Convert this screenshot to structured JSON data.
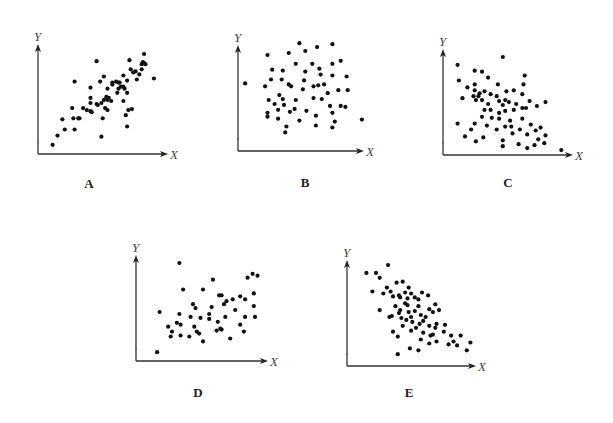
{
  "figure": {
    "background": "#ffffff",
    "dot_color": "#111111"
  },
  "chart_data": [
    {
      "type": "scatter",
      "panel": "A",
      "title": "A",
      "xlabel": "X",
      "ylabel": "Y",
      "xlim": [
        0,
        10
      ],
      "ylim": [
        0,
        10
      ],
      "grid": false,
      "trend": "strong positive",
      "points": [
        [
          1.2,
          0.9
        ],
        [
          1.6,
          1.8
        ],
        [
          2.0,
          3.4
        ],
        [
          2.2,
          2.4
        ],
        [
          2.8,
          4.5
        ],
        [
          2.9,
          3.5
        ],
        [
          3.0,
          2.4
        ],
        [
          3.0,
          7.1
        ],
        [
          3.3,
          3.5
        ],
        [
          3.4,
          3.5
        ],
        [
          3.7,
          4.5
        ],
        [
          4.0,
          4.3
        ],
        [
          4.3,
          6.5
        ],
        [
          4.3,
          5.5
        ],
        [
          4.3,
          5.0
        ],
        [
          4.4,
          4.1
        ],
        [
          4.3,
          4.2
        ],
        [
          4.8,
          9.1
        ],
        [
          4.8,
          4.9
        ],
        [
          4.9,
          4.8
        ],
        [
          5.1,
          7.1
        ],
        [
          5.2,
          5.0
        ],
        [
          5.2,
          1.7
        ],
        [
          5.3,
          3.5
        ],
        [
          5.4,
          7.6
        ],
        [
          5.4,
          5.3
        ],
        [
          5.5,
          4.5
        ],
        [
          5.6,
          5.6
        ],
        [
          5.7,
          4.3
        ],
        [
          5.7,
          6.4
        ],
        [
          5.7,
          5.3
        ],
        [
          5.8,
          5.5
        ],
        [
          6.0,
          5.2
        ],
        [
          6.1,
          6.8
        ],
        [
          6.1,
          7.0
        ],
        [
          6.4,
          7.1
        ],
        [
          6.6,
          7.0
        ],
        [
          6.6,
          6.4
        ],
        [
          6.5,
          6.0
        ],
        [
          6.7,
          7.0
        ],
        [
          6.8,
          6.6
        ],
        [
          7.0,
          7.7
        ],
        [
          7.0,
          5.2
        ],
        [
          7.0,
          6.6
        ],
        [
          7.1,
          6.4
        ],
        [
          7.2,
          3.8
        ],
        [
          7.3,
          7.2
        ],
        [
          7.3,
          6.0
        ],
        [
          7.3,
          2.7
        ],
        [
          7.4,
          4.3
        ],
        [
          7.5,
          9.2
        ],
        [
          7.6,
          8.3
        ],
        [
          7.8,
          8.0
        ],
        [
          7.7,
          4.4
        ],
        [
          8.0,
          8.1
        ],
        [
          8.1,
          7.3
        ],
        [
          8.3,
          7.8
        ],
        [
          8.5,
          8.3
        ],
        [
          8.5,
          8.8
        ],
        [
          8.6,
          9.0
        ],
        [
          8.7,
          9.8
        ],
        [
          8.7,
          8.9
        ],
        [
          8.8,
          8.8
        ],
        [
          9.5,
          7.4
        ]
      ]
    },
    {
      "type": "scatter",
      "panel": "B",
      "title": "B",
      "xlabel": "X",
      "ylabel": "Y",
      "xlim": [
        0,
        10
      ],
      "ylim": [
        0,
        10
      ],
      "grid": false,
      "trend": "no correlation",
      "points": [
        [
          0.6,
          6.9
        ],
        [
          2.5,
          9.8
        ],
        [
          5.2,
          11.0
        ],
        [
          4.3,
          10.0
        ],
        [
          5.7,
          10.2
        ],
        [
          6.7,
          10.6
        ],
        [
          8.0,
          10.9
        ],
        [
          4.9,
          8.9
        ],
        [
          6.3,
          8.9
        ],
        [
          8.0,
          8.9
        ],
        [
          8.7,
          9.2
        ],
        [
          2.9,
          8.3
        ],
        [
          3.8,
          8.2
        ],
        [
          5.7,
          8.1
        ],
        [
          6.9,
          8.4
        ],
        [
          9.2,
          7.6
        ],
        [
          2.8,
          7.3
        ],
        [
          3.7,
          7.3
        ],
        [
          5.6,
          7.2
        ],
        [
          7.0,
          7.8
        ],
        [
          8.0,
          7.7
        ],
        [
          2.3,
          6.6
        ],
        [
          4.5,
          6.6
        ],
        [
          5.5,
          6.3
        ],
        [
          4.3,
          6.8
        ],
        [
          7.3,
          6.8
        ],
        [
          6.4,
          6.6
        ],
        [
          6.8,
          6.7
        ],
        [
          8.5,
          6.2
        ],
        [
          3.5,
          5.7
        ],
        [
          3.8,
          5.3
        ],
        [
          4.9,
          5.2
        ],
        [
          6.4,
          5.4
        ],
        [
          7.1,
          5.3
        ],
        [
          7.6,
          5.9
        ],
        [
          9.3,
          6.2
        ],
        [
          2.6,
          5.2
        ],
        [
          3.1,
          4.8
        ],
        [
          3.9,
          4.7
        ],
        [
          4.8,
          4.3
        ],
        [
          7.8,
          4.6
        ],
        [
          8.7,
          4.6
        ],
        [
          2.5,
          3.9
        ],
        [
          3.4,
          4.2
        ],
        [
          4.4,
          4.0
        ],
        [
          5.8,
          4.1
        ],
        [
          8.0,
          3.9
        ],
        [
          9.1,
          4.5
        ],
        [
          2.5,
          3.5
        ],
        [
          3.4,
          3.3
        ],
        [
          5.2,
          3.1
        ],
        [
          6.6,
          3.6
        ],
        [
          8.2,
          3.0
        ],
        [
          4.1,
          2.5
        ],
        [
          6.6,
          2.6
        ],
        [
          8.0,
          2.4
        ],
        [
          4.0,
          1.9
        ],
        [
          10.5,
          3.2
        ]
      ]
    },
    {
      "type": "scatter",
      "panel": "C",
      "title": "C",
      "xlabel": "X",
      "ylabel": "Y",
      "xlim": [
        0,
        10
      ],
      "ylim": [
        0,
        10
      ],
      "grid": false,
      "trend": "moderate negative",
      "points": [
        [
          1.2,
          9.2
        ],
        [
          2.6,
          8.6
        ],
        [
          3.2,
          8.5
        ],
        [
          4.9,
          10.0
        ],
        [
          3.7,
          7.9
        ],
        [
          6.7,
          8.1
        ],
        [
          1.3,
          7.6
        ],
        [
          2.6,
          7.2
        ],
        [
          4.5,
          7.2
        ],
        [
          5.2,
          6.5
        ],
        [
          6.5,
          6.2
        ],
        [
          6.6,
          7.2
        ],
        [
          2.0,
          6.9
        ],
        [
          2.6,
          6.6
        ],
        [
          3.4,
          6.5
        ],
        [
          3.0,
          6.3
        ],
        [
          2.5,
          6.0
        ],
        [
          2.9,
          6.0
        ],
        [
          3.9,
          6.2
        ],
        [
          4.4,
          6.0
        ],
        [
          5.1,
          5.6
        ],
        [
          5.8,
          6.6
        ],
        [
          1.6,
          5.8
        ],
        [
          2.7,
          5.6
        ],
        [
          3.2,
          5.6
        ],
        [
          3.7,
          5.2
        ],
        [
          4.6,
          5.5
        ],
        [
          4.9,
          5.1
        ],
        [
          5.4,
          5.4
        ],
        [
          6.0,
          5.2
        ],
        [
          7.1,
          5.5
        ],
        [
          7.7,
          5.0
        ],
        [
          3.4,
          4.6
        ],
        [
          3.9,
          4.6
        ],
        [
          4.6,
          4.3
        ],
        [
          5.1,
          4.5
        ],
        [
          5.8,
          4.6
        ],
        [
          6.5,
          4.8
        ],
        [
          6.8,
          4.8
        ],
        [
          8.4,
          5.4
        ],
        [
          3.2,
          3.9
        ],
        [
          4.0,
          3.8
        ],
        [
          4.6,
          3.7
        ],
        [
          5.5,
          3.5
        ],
        [
          6.5,
          3.7
        ],
        [
          2.6,
          3.2
        ],
        [
          3.6,
          3.0
        ],
        [
          4.4,
          2.6
        ],
        [
          5.1,
          2.9
        ],
        [
          5.6,
          2.9
        ],
        [
          6.3,
          2.6
        ],
        [
          7.2,
          3.1
        ],
        [
          8.0,
          2.8
        ],
        [
          1.2,
          3.2
        ],
        [
          2.3,
          2.6
        ],
        [
          5.7,
          2.2
        ],
        [
          6.9,
          2.1
        ],
        [
          7.6,
          2.5
        ],
        [
          8.4,
          2.0
        ],
        [
          1.8,
          1.9
        ],
        [
          3.3,
          1.8
        ],
        [
          4.9,
          1.5
        ],
        [
          6.2,
          1.1
        ],
        [
          7.8,
          1.6
        ],
        [
          8.3,
          1.2
        ],
        [
          2.7,
          1.4
        ],
        [
          4.9,
          0.9
        ],
        [
          6.9,
          0.7
        ],
        [
          7.5,
          1.0
        ],
        [
          9.7,
          0.5
        ]
      ]
    },
    {
      "type": "scatter",
      "panel": "D",
      "title": "D",
      "xlabel": "X",
      "ylabel": "Y",
      "xlim": [
        0,
        10
      ],
      "ylim": [
        0,
        10
      ],
      "grid": false,
      "trend": "weak positive",
      "points": [
        [
          1.7,
          0.9
        ],
        [
          1.9,
          5.0
        ],
        [
          3.5,
          10.0
        ],
        [
          2.8,
          2.5
        ],
        [
          2.6,
          3.5
        ],
        [
          3.3,
          3.9
        ],
        [
          3.6,
          3.7
        ],
        [
          3.6,
          2.6
        ],
        [
          4.3,
          2.5
        ],
        [
          4.9,
          3.0
        ],
        [
          5.1,
          2.8
        ],
        [
          3.8,
          7.3
        ],
        [
          4.4,
          4.5
        ],
        [
          4.8,
          5.4
        ],
        [
          4.6,
          5.8
        ],
        [
          5.2,
          4.4
        ],
        [
          5.9,
          4.8
        ],
        [
          5.9,
          4.3
        ],
        [
          6.1,
          5.5
        ],
        [
          6.5,
          3.1
        ],
        [
          6.8,
          3.3
        ],
        [
          6.9,
          3.2
        ],
        [
          7.3,
          6.1
        ],
        [
          7.1,
          5.8
        ],
        [
          6.6,
          4.0
        ],
        [
          7.2,
          4.5
        ],
        [
          7.6,
          2.3
        ],
        [
          8.0,
          5.2
        ],
        [
          8.4,
          6.6
        ],
        [
          8.8,
          6.3
        ],
        [
          8.4,
          3.7
        ],
        [
          8.8,
          4.5
        ],
        [
          8.7,
          3.0
        ],
        [
          9.0,
          8.5
        ],
        [
          9.4,
          8.9
        ],
        [
          6.2,
          8.3
        ],
        [
          5.4,
          7.3
        ],
        [
          6.7,
          6.7
        ],
        [
          7.8,
          6.3
        ],
        [
          4.7,
          3.5
        ],
        [
          5.4,
          2.0
        ],
        [
          3.5,
          4.8
        ],
        [
          6.9,
          6.7
        ],
        [
          9.5,
          5.6
        ],
        [
          9.5,
          6.9
        ],
        [
          9.8,
          8.7
        ],
        [
          9.6,
          4.5
        ],
        [
          2.9,
          3.0
        ]
      ]
    },
    {
      "type": "scatter",
      "panel": "E",
      "title": "E",
      "xlabel": "X",
      "ylabel": "Y",
      "xlim": [
        0,
        10
      ],
      "ylim": [
        0,
        10
      ],
      "grid": false,
      "trend": "moderate-strong negative",
      "points": [
        [
          1.6,
          9.5
        ],
        [
          2.4,
          9.5
        ],
        [
          2.7,
          9.0
        ],
        [
          3.4,
          10.3
        ],
        [
          2.1,
          7.6
        ],
        [
          3.0,
          7.4
        ],
        [
          3.3,
          8.0
        ],
        [
          3.6,
          7.6
        ],
        [
          3.8,
          7.1
        ],
        [
          4.1,
          8.5
        ],
        [
          4.6,
          8.6
        ],
        [
          5.1,
          8.0
        ],
        [
          4.3,
          7.2
        ],
        [
          4.4,
          7.0
        ],
        [
          4.8,
          7.5
        ],
        [
          5.0,
          6.9
        ],
        [
          5.3,
          7.4
        ],
        [
          5.6,
          7.0
        ],
        [
          5.9,
          6.8
        ],
        [
          6.2,
          7.5
        ],
        [
          6.7,
          7.2
        ],
        [
          2.7,
          5.7
        ],
        [
          3.7,
          5.1
        ],
        [
          4.3,
          5.4
        ],
        [
          4.5,
          4.9
        ],
        [
          4.8,
          6.4
        ],
        [
          5.1,
          5.5
        ],
        [
          5.3,
          5.0
        ],
        [
          5.6,
          5.6
        ],
        [
          5.9,
          6.1
        ],
        [
          6.1,
          5.2
        ],
        [
          6.5,
          5.0
        ],
        [
          6.8,
          5.8
        ],
        [
          7.1,
          5.5
        ],
        [
          7.3,
          6.3
        ],
        [
          7.6,
          5.7
        ],
        [
          4.0,
          6.1
        ],
        [
          4.4,
          5.7
        ],
        [
          4.9,
          4.7
        ],
        [
          5.4,
          4.5
        ],
        [
          6.0,
          4.3
        ],
        [
          6.3,
          4.6
        ],
        [
          6.8,
          4.1
        ],
        [
          7.4,
          4.3
        ],
        [
          8.1,
          4.2
        ],
        [
          3.8,
          3.5
        ],
        [
          4.6,
          4.1
        ],
        [
          5.3,
          3.6
        ],
        [
          5.7,
          3.9
        ],
        [
          6.3,
          3.4
        ],
        [
          6.9,
          3.1
        ],
        [
          7.3,
          3.9
        ],
        [
          8.0,
          3.5
        ],
        [
          8.6,
          3.1
        ],
        [
          9.4,
          3.1
        ],
        [
          6.8,
          2.3
        ],
        [
          7.4,
          2.5
        ],
        [
          8.4,
          2.2
        ],
        [
          9.1,
          2.1
        ],
        [
          10.2,
          2.4
        ],
        [
          9.9,
          1.6
        ],
        [
          4.2,
          1.2
        ],
        [
          5.2,
          1.8
        ],
        [
          5.9,
          1.6
        ],
        [
          6.1,
          2.7
        ],
        [
          4.2,
          3.0
        ],
        [
          7.1,
          3.2
        ],
        [
          8.8,
          2.5
        ],
        [
          5.0,
          6.2
        ],
        [
          3.5,
          5.0
        ]
      ]
    }
  ]
}
